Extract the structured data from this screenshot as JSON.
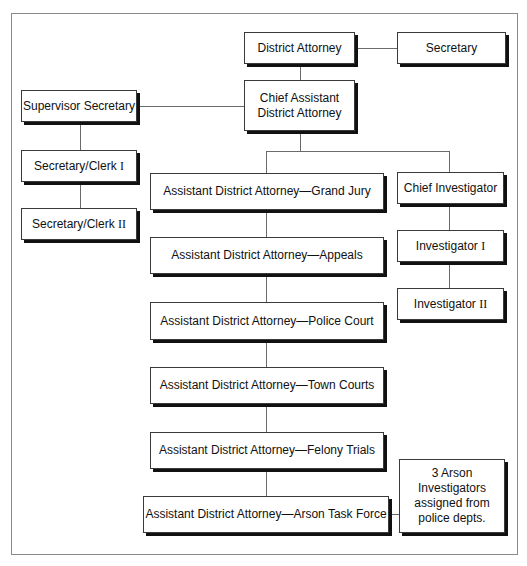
{
  "chart": {
    "nodes": {
      "district_attorney": {
        "label": "District Attorney"
      },
      "secretary": {
        "label": "Secretary"
      },
      "chief_assistant": {
        "line1": "Chief Assistant",
        "line2": "District Attorney"
      },
      "supervisor_secretary": {
        "label": "Supervisor Secretary"
      },
      "secretary_clerk_1": {
        "label": "Secretary/Clerk",
        "roman": "I"
      },
      "secretary_clerk_2": {
        "label": "Secretary/Clerk",
        "roman": "II"
      },
      "ada_grand_jury": {
        "label": "Assistant District Attorney—Grand Jury"
      },
      "ada_appeals": {
        "label": "Assistant District Attorney—Appeals"
      },
      "ada_police_court": {
        "label": "Assistant District Attorney—Police Court"
      },
      "ada_town_courts": {
        "label": "Assistant District Attorney—Town Courts"
      },
      "ada_felony_trials": {
        "label": "Assistant District Attorney—Felony Trials"
      },
      "ada_arson_task_force": {
        "label": "Assistant District Attorney—Arson Task Force"
      },
      "chief_investigator": {
        "label": "Chief Investigator"
      },
      "investigator_1": {
        "label": "Investigator",
        "roman": "I"
      },
      "investigator_2": {
        "label": "Investigator",
        "roman": "II"
      },
      "arson_investigators": {
        "line1": "3 Arson",
        "line2": "Investigators",
        "line3": "assigned from",
        "line4": "police depts."
      }
    },
    "edges": [
      [
        "district_attorney",
        "secretary"
      ],
      [
        "district_attorney",
        "chief_assistant"
      ],
      [
        "chief_assistant",
        "supervisor_secretary"
      ],
      [
        "supervisor_secretary",
        "secretary_clerk_1"
      ],
      [
        "secretary_clerk_1",
        "secretary_clerk_2"
      ],
      [
        "chief_assistant",
        "ada_grand_jury"
      ],
      [
        "chief_assistant",
        "chief_investigator"
      ],
      [
        "ada_grand_jury",
        "ada_appeals"
      ],
      [
        "ada_appeals",
        "ada_police_court"
      ],
      [
        "ada_police_court",
        "ada_town_courts"
      ],
      [
        "ada_town_courts",
        "ada_felony_trials"
      ],
      [
        "ada_felony_trials",
        "ada_arson_task_force"
      ],
      [
        "ada_arson_task_force",
        "arson_investigators"
      ],
      [
        "chief_investigator",
        "investigator_1"
      ],
      [
        "investigator_1",
        "investigator_2"
      ]
    ]
  }
}
